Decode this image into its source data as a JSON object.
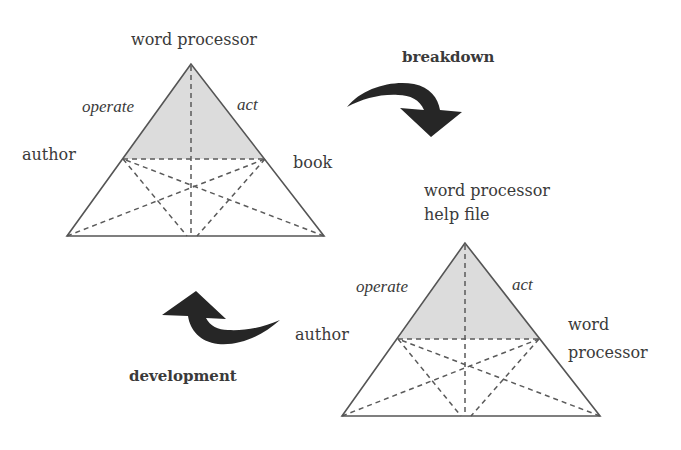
{
  "diagram": {
    "type": "activity-triangle-transition",
    "colors": {
      "background": "#ffffff",
      "shade": "#dcdcdc",
      "lines": "#555555",
      "arrow": "#262626",
      "text": "#3a3a3a"
    },
    "triangle_top_left": {
      "apex_label": "word processor",
      "left_edge_label": "operate",
      "right_edge_label": "act",
      "left_vertex_label": "author",
      "right_vertex_label": "book"
    },
    "triangle_bottom_right": {
      "apex_label_line1": "word processor",
      "apex_label_line2": "help file",
      "left_edge_label": "operate",
      "right_edge_label": "act",
      "left_vertex_label": "author",
      "right_vertex_label_line1": "word",
      "right_vertex_label_line2": "processor"
    },
    "arrows": {
      "breakdown_label": "breakdown",
      "development_label": "development"
    }
  }
}
